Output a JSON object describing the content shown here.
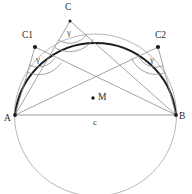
{
  "figure": {
    "background": "#ffffff",
    "width": 192,
    "height": 194,
    "colors": {
      "arc_bold": "#1a1a1a",
      "circle_light": "#9a9a9a",
      "chord": "#8f8f8f",
      "ray": "#8a8a8a",
      "point": "#1a1a1a",
      "text": "#2b2b2b",
      "angle_arc": "#8a8a8a"
    }
  },
  "labels": {
    "apex_c": "C",
    "point_c1": "C1",
    "point_c2": "C2",
    "point_a": "A",
    "point_b": "B",
    "center_m": "M",
    "chord_c": "c",
    "gamma_at_c": "γ",
    "gamma_at_c1": "γ",
    "gamma_at_c2": "γ"
  },
  "geometry": {
    "circle": {
      "cx": 95.5,
      "cy": 115,
      "r": 81
    },
    "points": {
      "A": {
        "x": 15,
        "y": 115
      },
      "B": {
        "x": 176,
        "y": 115
      },
      "M": {
        "x": 93,
        "y": 98
      },
      "C": {
        "x": 70,
        "y": 21
      },
      "C1": {
        "x": 35,
        "y": 47
      },
      "C2": {
        "x": 158,
        "y": 47
      }
    },
    "label_positions": {
      "C": {
        "x": 65,
        "y": 7
      },
      "C1": {
        "x": 23,
        "y": 34
      },
      "C2": {
        "x": 155,
        "y": 34
      },
      "A": {
        "x": 5,
        "y": 113
      },
      "B": {
        "x": 179,
        "y": 112
      },
      "M": {
        "x": 98,
        "y": 92
      },
      "c": {
        "x": 93,
        "y": 119
      },
      "gamma_C": {
        "x": 66,
        "y": 29
      },
      "gamma_C1": {
        "x": 36,
        "y": 58
      },
      "gamma_C2": {
        "x": 150,
        "y": 58
      }
    },
    "angle_label": "γ",
    "chord_label": "c",
    "description": "Circle with centre M, chord AB labelled c, three apex points C, C1 and C2 on the major arc each subtending the same inscribed angle gamma over AB."
  }
}
